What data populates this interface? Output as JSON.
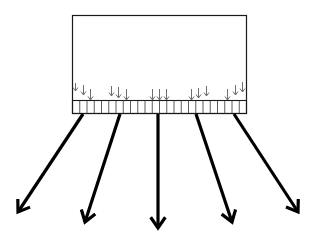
{
  "diagram": {
    "colors": {
      "background": "#ffffff",
      "outline": "#1a1a1a",
      "small_arrows": "#6e6e6e",
      "strip_lines": "#333333",
      "big_arrows": "#000000"
    },
    "block": {
      "x": 72,
      "y": 15,
      "width": 174,
      "height": 85
    },
    "strip": {
      "x": 72,
      "y": 100,
      "width": 174,
      "height": 13,
      "segments": 24
    },
    "small_arrow_groups": [
      {
        "arrows": [
          {
            "x": 75,
            "y1": 83,
            "y2": 91
          },
          {
            "x": 83,
            "y1": 85,
            "y2": 95
          },
          {
            "x": 90,
            "y1": 89,
            "y2": 100
          }
        ]
      },
      {
        "arrows": [
          {
            "x": 111,
            "y1": 86,
            "y2": 96
          },
          {
            "x": 118,
            "y1": 87,
            "y2": 98
          },
          {
            "x": 126,
            "y1": 89,
            "y2": 100
          }
        ]
      },
      {
        "arrows": [
          {
            "x": 152,
            "y1": 89,
            "y2": 100
          },
          {
            "x": 159,
            "y1": 89,
            "y2": 100
          },
          {
            "x": 166,
            "y1": 89,
            "y2": 100
          }
        ]
      },
      {
        "arrows": [
          {
            "x": 191,
            "y1": 89,
            "y2": 100
          },
          {
            "x": 198,
            "y1": 88,
            "y2": 98
          },
          {
            "x": 206,
            "y1": 86,
            "y2": 96
          }
        ]
      },
      {
        "arrows": [
          {
            "x": 227,
            "y1": 89,
            "y2": 100
          },
          {
            "x": 235,
            "y1": 85,
            "y2": 95
          },
          {
            "x": 242,
            "y1": 82,
            "y2": 92
          }
        ]
      }
    ],
    "big_arrows": [
      {
        "x1": 83,
        "y1": 114,
        "x2": 18,
        "y2": 212
      },
      {
        "x1": 120,
        "y1": 114,
        "x2": 85,
        "y2": 222
      },
      {
        "x1": 158,
        "y1": 114,
        "x2": 158,
        "y2": 228
      },
      {
        "x1": 196,
        "y1": 114,
        "x2": 232,
        "y2": 222
      },
      {
        "x1": 234,
        "y1": 114,
        "x2": 298,
        "y2": 212
      }
    ]
  }
}
